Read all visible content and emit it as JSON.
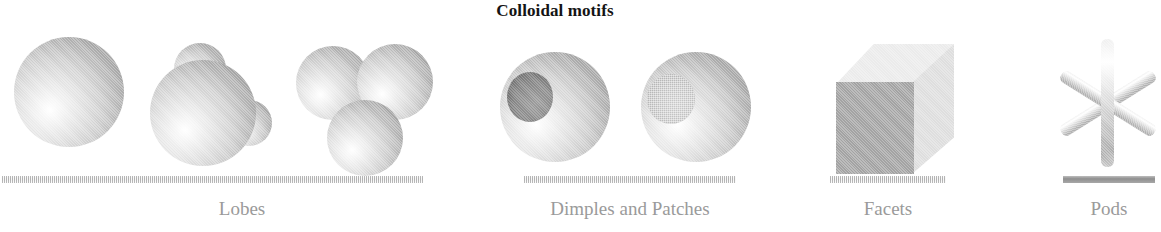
{
  "figure": {
    "title": "Colloidal motifs",
    "background_color": "#ffffff",
    "width": 1161,
    "height": 232
  },
  "palette": {
    "title_color": "#141414",
    "label_color": "#9a9a9a",
    "substrate_color": "#cfcfcf",
    "substrate_solid_color": "#8f8f8f",
    "sphere_highlight": "#ffffff",
    "sphere_shadow": "#8c8c8c",
    "dimple_color": "#828282",
    "patch_color": "#c0c0c0",
    "cube_front": "#a3a3a3",
    "cube_side": "#dedede",
    "cube_top": "#ebebeb"
  },
  "motifs": [
    {
      "id": "lobes",
      "label": "Lobes",
      "particles": [
        {
          "name": "single-sphere",
          "shape": "sphere"
        },
        {
          "name": "sphere-with-two-lobes",
          "shape": "lobed-sphere"
        },
        {
          "name": "sphere-trimer",
          "shape": "trimer"
        }
      ]
    },
    {
      "id": "dimples-and-patches",
      "label": "Dimples and Patches",
      "particles": [
        {
          "name": "dimpled-sphere",
          "shape": "sphere-with-dimple"
        },
        {
          "name": "patched-sphere",
          "shape": "sphere-with-patch"
        }
      ]
    },
    {
      "id": "facets",
      "label": "Facets",
      "particles": [
        {
          "name": "cube",
          "shape": "cube"
        }
      ]
    },
    {
      "id": "pods",
      "label": "Pods",
      "particles": [
        {
          "name": "six-arm-star",
          "shape": "tripod-star",
          "arm_count": 6
        }
      ]
    }
  ]
}
